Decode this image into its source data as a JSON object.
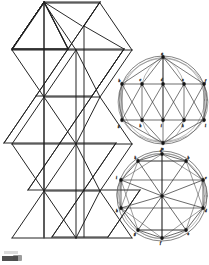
{
  "document": {
    "kind": "scanned-geometric-figure",
    "caption": "",
    "background_color": "#ffffff",
    "ink_color": "#1a1a1a",
    "faint_ink_color": "#6e6e6e",
    "width_px": 209,
    "height_px": 265
  },
  "figures": [
    {
      "id": "triangular-strip-net",
      "name": "Triangular strip net",
      "position": "left",
      "description": "Zigzag strip of equilateral triangles forming the unrolled lateral net of an antiprism / icosahedral band",
      "rows": 5,
      "columns": 2,
      "origin_x": 6,
      "origin_y": 4,
      "cell_width": 56,
      "cell_height": 49,
      "vertical_rib_count": 3,
      "stroke_width": 0.9
    },
    {
      "id": "upper-circular-projection",
      "name": "Upper circular projection",
      "position": "top-right",
      "description": "Circle with inscribed apex vertex, horizontal chord rows and radiating chords; vertices marked with small dark nodes and italic letter labels",
      "center_x": 163,
      "center_y": 100,
      "radius": 43,
      "outer_radius": 44.5,
      "apex_y": 57,
      "upper_row_y": 83,
      "lower_row_y": 121,
      "bottom_y": 143,
      "upper_row_x": [
        133,
        148,
        163,
        178,
        193
      ],
      "lower_row_x": [
        133,
        148,
        163,
        178,
        193
      ],
      "node_labels": [
        "a",
        "b",
        "c",
        "d",
        "e",
        "f",
        "g",
        "h",
        "i",
        "k",
        "l",
        "m"
      ],
      "stroke_width": 0.6
    },
    {
      "id": "lower-polar-projection",
      "name": "Lower polar projection",
      "position": "bottom-right",
      "description": "Circle with inscribed decagon, central hub vertex and spokes radiating to every polygon vertex, plus secondary chord web",
      "center_x": 162,
      "center_y": 195,
      "radius": 44,
      "outer_radius": 45.5,
      "polygon_sides": 10,
      "hub_marked": true,
      "node_labels": [
        "a",
        "b",
        "c",
        "d",
        "e",
        "f",
        "g",
        "h",
        "i",
        "k"
      ],
      "stroke_width": 0.6
    }
  ],
  "annotations": {
    "scan_mark_bottom_left": "dark scan artifact at lower-left page edge"
  }
}
